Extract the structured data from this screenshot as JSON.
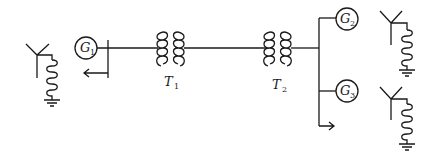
{
  "diagram": {
    "type": "single-line power system diagram",
    "generators": [
      {
        "id": "G1",
        "letter": "G",
        "sub": "1"
      },
      {
        "id": "G2",
        "letter": "G",
        "sub": "2"
      },
      {
        "id": "G3",
        "letter": "G",
        "sub": "3"
      }
    ],
    "transformers": [
      {
        "id": "T1",
        "letter": "T",
        "sub": "1"
      },
      {
        "id": "T2",
        "letter": "T",
        "sub": "2"
      }
    ],
    "grounding": [
      {
        "id": "left-wye-reactor-ground"
      },
      {
        "id": "right-top-wye-reactor-ground"
      },
      {
        "id": "right-bottom-wye-reactor-ground"
      }
    ],
    "loads": [
      {
        "id": "load-bus1"
      },
      {
        "id": "load-bus2"
      }
    ],
    "stroke_color": "#1a1a1a",
    "background": "#ffffff"
  }
}
